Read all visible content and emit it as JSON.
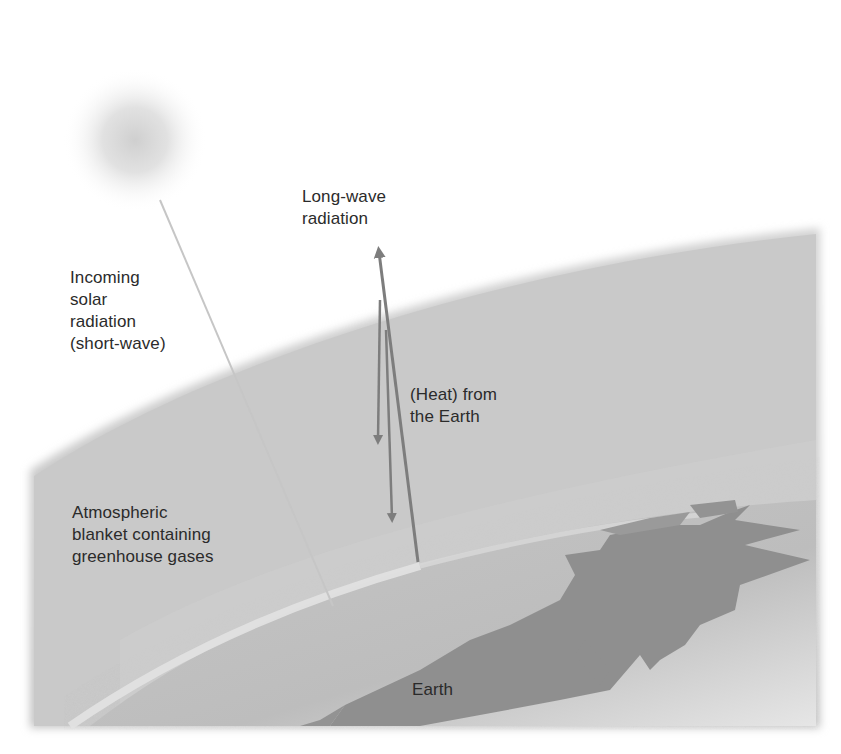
{
  "diagram": {
    "title": "",
    "elements": {
      "sun": "sun",
      "atmosphere": "atmospheric blanket",
      "earth": "earth surface with land mass"
    },
    "labels": {
      "incoming": "Incoming\nsolar\nradiation\n(short-wave)",
      "longwave": "Long-wave\nradiation",
      "heat": "(Heat) from\nthe Earth",
      "blanket": "Atmospheric\nblanket containing\ngreenhouse gases",
      "earth": "Earth"
    },
    "colors": {
      "background": "#ffffff",
      "atmosphere": "#c9c9c9",
      "earth_surface": "#bdbdbd",
      "land": "#8e8e8e",
      "arrow": "#7d7d7d",
      "sun_ray": "#c8c8c8",
      "text": "#2b2b2b"
    },
    "arrows": [
      {
        "name": "incoming-solar-ray",
        "direction": "down",
        "from": [
          160,
          200
        ],
        "to": [
          333,
          606
        ]
      },
      {
        "name": "long-wave-escape-arrow",
        "direction": "up",
        "from": [
          418,
          560
        ],
        "to": [
          378,
          245
        ]
      },
      {
        "name": "reradiated-arrow-1",
        "direction": "down",
        "from": [
          378,
          330
        ],
        "to": [
          378,
          445
        ]
      },
      {
        "name": "reradiated-arrow-2",
        "direction": "down",
        "from": [
          390,
          380
        ],
        "to": [
          392,
          520
        ]
      }
    ]
  }
}
